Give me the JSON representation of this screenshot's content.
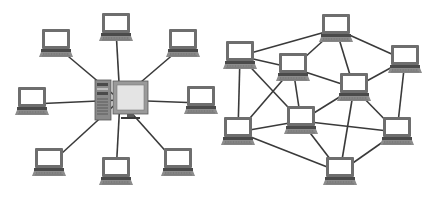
{
  "diagrams": [
    {
      "name": "star-topology",
      "hub": {
        "id": "server",
        "x": 120,
        "y": 100
      },
      "nodes": [
        {
          "id": "top-left",
          "x": 56,
          "y": 44
        },
        {
          "id": "top",
          "x": 116,
          "y": 28
        },
        {
          "id": "top-right",
          "x": 183,
          "y": 44
        },
        {
          "id": "left",
          "x": 32,
          "y": 102
        },
        {
          "id": "right",
          "x": 201,
          "y": 101
        },
        {
          "id": "bottom-left",
          "x": 49,
          "y": 163
        },
        {
          "id": "bottom",
          "x": 116,
          "y": 172
        },
        {
          "id": "bottom-right",
          "x": 178,
          "y": 163
        }
      ],
      "edges": [
        [
          "hub",
          "top-left"
        ],
        [
          "hub",
          "top"
        ],
        [
          "hub",
          "top-right"
        ],
        [
          "hub",
          "left"
        ],
        [
          "hub",
          "right"
        ],
        [
          "hub",
          "bottom-left"
        ],
        [
          "hub",
          "bottom"
        ],
        [
          "hub",
          "bottom-right"
        ]
      ]
    },
    {
      "name": "mesh-topology",
      "nodes": [
        {
          "id": "A",
          "x": 336,
          "y": 29
        },
        {
          "id": "B",
          "x": 240,
          "y": 56
        },
        {
          "id": "C",
          "x": 293,
          "y": 68
        },
        {
          "id": "D",
          "x": 405,
          "y": 60
        },
        {
          "id": "E",
          "x": 354,
          "y": 88
        },
        {
          "id": "F",
          "x": 301,
          "y": 121
        },
        {
          "id": "G",
          "x": 238,
          "y": 132
        },
        {
          "id": "H",
          "x": 397,
          "y": 132
        },
        {
          "id": "I",
          "x": 340,
          "y": 172
        }
      ],
      "edges": [
        [
          "A",
          "B"
        ],
        [
          "A",
          "C"
        ],
        [
          "A",
          "E"
        ],
        [
          "A",
          "D"
        ],
        [
          "B",
          "C"
        ],
        [
          "B",
          "G"
        ],
        [
          "B",
          "F"
        ],
        [
          "C",
          "E"
        ],
        [
          "C",
          "G"
        ],
        [
          "C",
          "F"
        ],
        [
          "D",
          "E"
        ],
        [
          "D",
          "H"
        ],
        [
          "E",
          "F"
        ],
        [
          "E",
          "I"
        ],
        [
          "E",
          "H"
        ],
        [
          "F",
          "G"
        ],
        [
          "F",
          "H"
        ],
        [
          "F",
          "I"
        ],
        [
          "G",
          "I"
        ],
        [
          "H",
          "I"
        ]
      ]
    }
  ],
  "colors": {
    "background": "#ffffff",
    "line": "#3a3a3a",
    "device_frame": "#6e6e6e",
    "device_dark": "#4a4a4a",
    "screen": "#ffffff",
    "keyboard": "#8c8c8c",
    "monitor_screen": "#e4e4e4"
  }
}
